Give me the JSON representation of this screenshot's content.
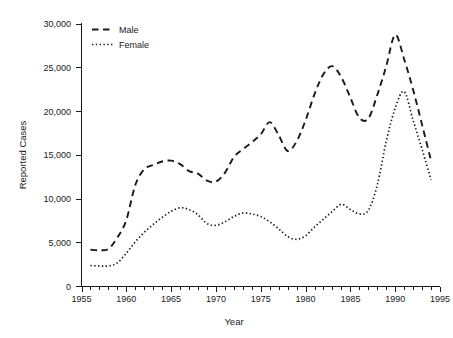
{
  "chart_data": {
    "type": "line",
    "title": "",
    "xlabel": "Year",
    "ylabel": "Reported Cases",
    "xlim": [
      1955,
      1995
    ],
    "ylim": [
      0,
      30000
    ],
    "grid": false,
    "legend_position": "top-left-inside",
    "x_tick_labels": [
      "1955",
      "1960",
      "1965",
      "1970",
      "1975",
      "1980",
      "1985",
      "1990",
      "1995"
    ],
    "x_major_ticks": [
      1955,
      1960,
      1965,
      1970,
      1975,
      1980,
      1985,
      1990,
      1995
    ],
    "x_minor_tick_interval": 1,
    "y_tick_labels": [
      "0",
      "5,000",
      "10,000",
      "15,000",
      "20,000",
      "25,000",
      "30,000"
    ],
    "y_major_ticks": [
      0,
      5000,
      10000,
      15000,
      20000,
      25000,
      30000
    ],
    "x": [
      1956,
      1957,
      1958,
      1959,
      1960,
      1961,
      1962,
      1963,
      1964,
      1965,
      1966,
      1967,
      1968,
      1969,
      1970,
      1971,
      1972,
      1973,
      1974,
      1975,
      1976,
      1977,
      1978,
      1979,
      1980,
      1981,
      1982,
      1983,
      1984,
      1985,
      1986,
      1987,
      1988,
      1989,
      1990,
      1991,
      1992,
      1993,
      1994
    ],
    "series": [
      {
        "name": "Male",
        "line_style": "dashed",
        "color": "#1a1a1a",
        "values": [
          4200,
          4150,
          4300,
          5600,
          7600,
          11600,
          13400,
          13900,
          14300,
          14400,
          14000,
          13200,
          12900,
          12100,
          12000,
          13000,
          14800,
          15700,
          16500,
          17400,
          18800,
          17300,
          15500,
          16600,
          19000,
          22000,
          24300,
          25200,
          23900,
          21600,
          19300,
          19200,
          21900,
          25200,
          28800,
          26000,
          22500,
          18500,
          14400
        ]
      },
      {
        "name": "Female",
        "line_style": "dotted",
        "color": "#1a1a1a",
        "values": [
          2400,
          2350,
          2350,
          2700,
          3800,
          5100,
          6200,
          7100,
          7900,
          8600,
          9000,
          8800,
          8200,
          7200,
          7000,
          7400,
          8000,
          8400,
          8300,
          8000,
          7400,
          6600,
          5700,
          5400,
          5800,
          6800,
          7700,
          8600,
          9400,
          8800,
          8300,
          8700,
          11600,
          16600,
          20400,
          22300,
          19000,
          15700,
          12200
        ]
      }
    ],
    "annotations": []
  },
  "legend": {
    "items": [
      {
        "label": "Male",
        "style": "dashed"
      },
      {
        "label": "Female",
        "style": "dotted"
      }
    ]
  },
  "axes": {
    "y_title": "Reported Cases",
    "x_title": "Year"
  }
}
